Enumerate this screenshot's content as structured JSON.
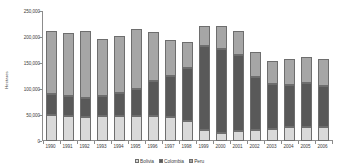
{
  "chart_data": {
    "type": "bar",
    "stacked": true,
    "title": "",
    "subtitle": "",
    "xlabel": "",
    "ylabel": "Hectares",
    "ylim": [
      0,
      250000
    ],
    "ytick_labels": [
      "250,000",
      "200,000",
      "150,000",
      "100,000",
      "50,000",
      "0"
    ],
    "ytick_values": [
      250000,
      200000,
      150000,
      100000,
      50000,
      0
    ],
    "grid": false,
    "legend_position": "bottom",
    "categories": [
      "1990",
      "1991",
      "1992",
      "1993",
      "1994",
      "1995",
      "1996",
      "1997",
      "1998",
      "1999",
      "2000",
      "2001",
      "2002",
      "2003",
      "2004",
      "2005",
      "2006"
    ],
    "series": [
      {
        "name": "Bolivia",
        "color": "#d9d9d9",
        "values": [
          50300,
          47900,
          45300,
          47200,
          48100,
          48600,
          48100,
          45800,
          38000,
          21800,
          14600,
          19900,
          21600,
          23600,
          27700,
          26500,
          27500
        ]
      },
      {
        "name": "Colombia",
        "color": "#595959",
        "values": [
          40100,
          38700,
          37100,
          39700,
          45000,
          50900,
          67200,
          79500,
          101800,
          160100,
          163300,
          144800,
          102000,
          86000,
          80000,
          86000,
          78000
        ]
      },
      {
        "name": "Peru",
        "color": "#a6a6a6",
        "values": [
          121300,
          120800,
          129100,
          108800,
          108600,
          115300,
          94400,
          68800,
          51000,
          38400,
          43400,
          46200,
          46700,
          44200,
          50300,
          48200,
          51400
        ]
      }
    ],
    "totals": [
      211700,
      207400,
      211500,
      195700,
      201700,
      214800,
      209700,
      194100,
      190800,
      220300,
      221300,
      210900,
      170300,
      153800,
      158000,
      160700,
      156900
    ]
  },
  "legend": {
    "items": [
      {
        "label": "Bolivia",
        "color": "#d9d9d9"
      },
      {
        "label": "Colombia",
        "color": "#595959"
      },
      {
        "label": "Peru",
        "color": "#a6a6a6"
      }
    ]
  },
  "colors": {
    "bolivia": "#d9d9d9",
    "colombia": "#595959",
    "peru": "#a6a6a6",
    "axis": "#8c8c8c",
    "text": "#3d3d3d",
    "background": "#ffffff"
  }
}
